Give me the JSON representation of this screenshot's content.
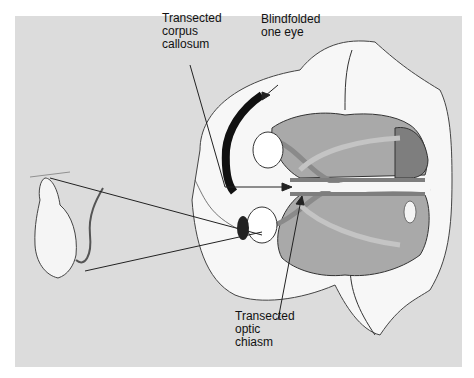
{
  "figure": {
    "labels": {
      "corpus_callosum": "Transected\ncorpus\ncallosum",
      "blindfolded": "Blindfolded\none eye",
      "optic_chiasm": "Transected\noptic\nchiasm"
    },
    "colors": {
      "panel_bg": "#dcdcdc",
      "brain_tissue": "#a9a9a9",
      "brain_dark": "#7e7e7e",
      "optic_tract": "#8a8a8a",
      "optic_tract_light": "#c4c4c4",
      "fur": "#f7f7f7",
      "blindfold": "#111111"
    }
  }
}
